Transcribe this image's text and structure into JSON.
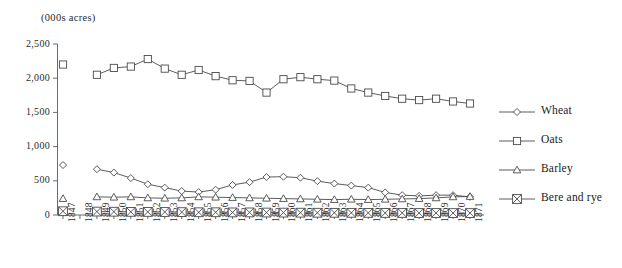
{
  "axis_unit_label": "(000s acres)",
  "legend": {
    "position": "right",
    "entries": [
      {
        "label": "Wheat",
        "marker": "diamond-marker"
      },
      {
        "label": "Oats",
        "marker": "square-marker"
      },
      {
        "label": "Barley",
        "marker": "triangle-marker"
      },
      {
        "label": "Bere and rye",
        "marker": "crossed-square-marker"
      }
    ]
  },
  "chart_data": {
    "type": "line",
    "title": "",
    "subtitle": "",
    "xlabel": "",
    "ylabel": "(000s acres)",
    "ylim": [
      0,
      2500
    ],
    "yticks": [
      "0",
      "500",
      "1,000",
      "1,500",
      "2,000",
      "2,500"
    ],
    "ytick_values": [
      0,
      500,
      1000,
      1500,
      2000,
      2500
    ],
    "grid": false,
    "legend_position": "right",
    "note": "1847 markers are plotted without a connecting line; 1848 has no data, so the lines begin at 1849.",
    "x": [
      "1847",
      "1848",
      "1849",
      "1850",
      "1851",
      "1852",
      "1853",
      "1854",
      "1855",
      "1856",
      "1857",
      "1858",
      "1859",
      "1860",
      "1861",
      "1862",
      "1863",
      "1864",
      "1865",
      "1866",
      "1867",
      "1868",
      "1869",
      "1870",
      "1871"
    ],
    "categories": [
      "1847",
      "1848",
      "1849",
      "1850",
      "1851",
      "1852",
      "1853",
      "1854",
      "1855",
      "1856",
      "1857",
      "1858",
      "1859",
      "1860",
      "1861",
      "1862",
      "1863",
      "1864",
      "1865",
      "1866",
      "1867",
      "1868",
      "1869",
      "1870",
      "1871"
    ],
    "series": [
      {
        "name": "Wheat",
        "marker": "diamond",
        "values": [
          730,
          null,
          670,
          620,
          540,
          450,
          400,
          350,
          335,
          370,
          440,
          480,
          555,
          560,
          545,
          495,
          460,
          430,
          400,
          330,
          290,
          280,
          290,
          290,
          265
        ]
      },
      {
        "name": "Oats",
        "marker": "square",
        "values": [
          2200,
          null,
          2050,
          2150,
          2170,
          2280,
          2140,
          2050,
          2120,
          2030,
          1970,
          1960,
          1790,
          1985,
          2015,
          1985,
          1965,
          1850,
          1790,
          1740,
          1700,
          1680,
          1700,
          1660,
          1630
        ]
      },
      {
        "name": "Barley",
        "marker": "triangle",
        "values": [
          240,
          null,
          265,
          260,
          265,
          250,
          245,
          250,
          265,
          260,
          255,
          250,
          245,
          240,
          235,
          230,
          225,
          230,
          225,
          230,
          235,
          240,
          250,
          265,
          270
        ]
      },
      {
        "name": "Bere and rye",
        "marker": "crossed-square",
        "values": [
          55,
          null,
          50,
          48,
          46,
          45,
          44,
          42,
          40,
          40,
          38,
          38,
          36,
          35,
          34,
          33,
          32,
          32,
          31,
          30,
          30,
          29,
          29,
          28,
          28
        ]
      }
    ]
  }
}
